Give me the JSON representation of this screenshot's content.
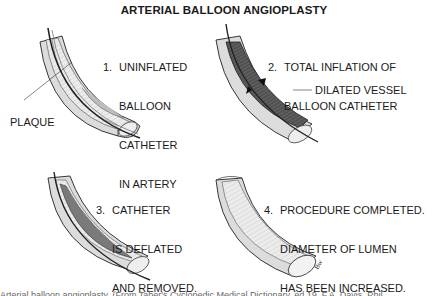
{
  "title": "ARTERIAL BALLOON ANGIOPLASTY",
  "panels": [
    {
      "step": "1.",
      "lines": [
        "UNINFLATED",
        "BALLOON",
        "CATHETER",
        "IN ARTERY"
      ],
      "callout": "PLAQUE"
    },
    {
      "step": "2.",
      "lines": [
        "TOTAL INFLATION OF",
        "BALLOON CATHETER"
      ],
      "callout": "DILATED VESSEL"
    },
    {
      "step": "3.",
      "lines": [
        "CATHETER",
        "IS DEFLATED",
        "AND REMOVED."
      ]
    },
    {
      "step": "4.",
      "lines": [
        "PROCEDURE COMPLETED.",
        "DIAMETER OF LUMEN",
        "HAS BEEN INCREASED."
      ]
    }
  ],
  "caption": "Arterial balloon angioplasty. (From Taber's Cyclopedic Medical Dictionary, ed 19. F.A. Davis, Phil",
  "colors": {
    "ink": "#1a1a1a",
    "wall": "#d9d9d9",
    "wall_light": "#ededed",
    "balloon": "#5a5a5a",
    "plaque": "#bdbdbd"
  }
}
